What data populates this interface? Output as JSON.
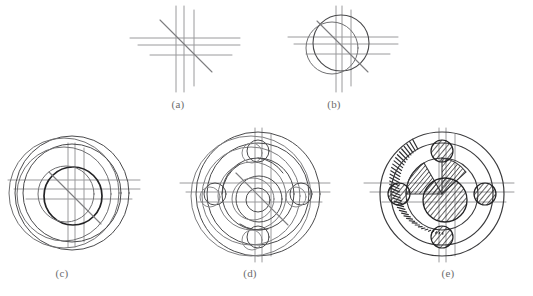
{
  "figure": {
    "background_color": "#ffffff",
    "line_color": "#4a4a4c",
    "construction_color": "#9a9a9c",
    "hatch_color": "#2e2e30",
    "width": 533,
    "height": 296
  },
  "panels": [
    {
      "id": "a",
      "caption": "(a)",
      "caption_x": 178,
      "caption_y": 103,
      "center_x": 185,
      "center_y": 45,
      "description": "Construction centrelines only: three vertical lines, three horizontal lines and one inclined 45-degree line crossing at the layout origin.",
      "vertical_lines": [
        176,
        184,
        194
      ],
      "horizontal_lines": [
        38,
        45,
        55
      ],
      "diagonal": {
        "x1": 160,
        "y1": 20,
        "x2": 212,
        "y2": 72
      },
      "vertical_extent": {
        "top": 6,
        "bottom": 92
      },
      "horizontal_extent": {
        "left": 130,
        "right": 240
      }
    },
    {
      "id": "b",
      "caption": "(b)",
      "caption_x": 334,
      "caption_y": 103,
      "center_x": 341,
      "center_y": 45,
      "description": "Two overlapping construction circles added on the same centreline grid, establishing the offset of the disc outline.",
      "circles": [
        {
          "cx": 341,
          "cy": 43,
          "r": 28
        },
        {
          "cx": 332,
          "cy": 48,
          "r": 26
        }
      ],
      "vertical_lines": [
        336,
        342,
        351
      ],
      "horizontal_lines": [
        37,
        44,
        54
      ],
      "diagonal": {
        "x1": 317,
        "y1": 21,
        "x2": 368,
        "y2": 72
      },
      "vertical_extent": {
        "top": 6,
        "bottom": 92
      },
      "horizontal_extent": {
        "left": 288,
        "right": 398
      }
    },
    {
      "id": "c",
      "caption": "(c)",
      "caption_x": 62,
      "caption_y": 272,
      "center_x": 70,
      "center_y": 193,
      "description": "Outer rim circles and the central bore outline are drawn, doubled to show the offset construction overlay.",
      "circles": [
        {
          "cx": 72,
          "cy": 193,
          "r": 57,
          "weight": "thin"
        },
        {
          "cx": 64,
          "cy": 193,
          "r": 55,
          "weight": "thin"
        },
        {
          "cx": 72,
          "cy": 193,
          "r": 49,
          "weight": "thin"
        },
        {
          "cx": 64,
          "cy": 194,
          "r": 47,
          "weight": "thin"
        },
        {
          "cx": 73,
          "cy": 196,
          "r": 29,
          "weight": "thick"
        },
        {
          "cx": 66,
          "cy": 194,
          "r": 28,
          "weight": "thin"
        }
      ],
      "vertical_lines": [
        68,
        75,
        84
      ],
      "horizontal_lines": [
        180,
        189,
        199
      ],
      "diagonal": {
        "x1": 49,
        "y1": 172,
        "x2": 101,
        "y2": 224
      },
      "vertical_extent": {
        "top": 143,
        "bottom": 247
      },
      "horizontal_extent": {
        "left": 8,
        "right": 140
      }
    },
    {
      "id": "d",
      "caption": "(d)",
      "caption_x": 250,
      "caption_y": 272,
      "center_x": 258,
      "center_y": 193,
      "description": "Bolt circle laid out with four equally spaced holes at the cardinal positions, plus inner boss circles.",
      "circles": [
        {
          "cx": 258,
          "cy": 194,
          "r": 62,
          "weight": "thin"
        },
        {
          "cx": 251,
          "cy": 196,
          "r": 60,
          "weight": "thin"
        },
        {
          "cx": 258,
          "cy": 194,
          "r": 51,
          "weight": "thin"
        },
        {
          "cx": 251,
          "cy": 196,
          "r": 49,
          "weight": "thin"
        },
        {
          "cx": 258,
          "cy": 194,
          "r": 36,
          "weight": "thin"
        },
        {
          "cx": 252,
          "cy": 196,
          "r": 34,
          "weight": "thin"
        },
        {
          "cx": 259,
          "cy": 199,
          "r": 23,
          "weight": "thin"
        },
        {
          "cx": 253,
          "cy": 199,
          "r": 21,
          "weight": "thin"
        },
        {
          "cx": 258,
          "cy": 200,
          "r": 12,
          "weight": "thin"
        }
      ],
      "bolt_circle_radius": 43,
      "bolt_holes": [
        {
          "cx": 258,
          "cy": 151,
          "r": 11
        },
        {
          "cx": 301,
          "cy": 194,
          "r": 11
        },
        {
          "cx": 258,
          "cy": 237,
          "r": 11
        },
        {
          "cx": 215,
          "cy": 194,
          "r": 11
        }
      ],
      "bolt_holes_offset": [
        {
          "cx": 252,
          "cy": 153,
          "r": 10
        },
        {
          "cx": 296,
          "cy": 197,
          "r": 10
        },
        {
          "cx": 252,
          "cy": 240,
          "r": 10
        },
        {
          "cx": 210,
          "cy": 197,
          "r": 10
        }
      ],
      "vertical_lines": [
        255,
        262,
        271
      ],
      "horizontal_lines": [
        183,
        192,
        202
      ],
      "diagonal": {
        "x1": 236,
        "y1": 173,
        "x2": 288,
        "y2": 225
      },
      "vertical_extent": {
        "top": 128,
        "bottom": 262
      },
      "horizontal_extent": {
        "left": 180,
        "right": 330
      }
    },
    {
      "id": "e",
      "caption": "(e)",
      "caption_x": 448,
      "caption_y": 272,
      "center_x": 442,
      "center_y": 193,
      "description": "Finished sectional view: rim band filled with radial hatching, and the four bolt holes plus the central boss rendered with section hatching at alternating angles.",
      "circles": [
        {
          "cx": 442,
          "cy": 194,
          "r": 62,
          "weight": "thin"
        },
        {
          "cx": 442,
          "cy": 194,
          "r": 51,
          "weight": "thin"
        },
        {
          "cx": 442,
          "cy": 194,
          "r": 36,
          "weight": "thin"
        },
        {
          "cx": 442,
          "cy": 199,
          "r": 23,
          "weight": "thin"
        }
      ],
      "rim_hatch": {
        "inner_r": 51,
        "outer_r": 62,
        "start_deg": 118,
        "end_deg": 262,
        "step_deg": 3.6
      },
      "bolt_holes": [
        {
          "cx": 442,
          "cy": 151,
          "r": 11,
          "hatch_angle": 40
        },
        {
          "cx": 485,
          "cy": 194,
          "r": 11,
          "hatch_angle": 40
        },
        {
          "cx": 442,
          "cy": 237,
          "r": 11,
          "hatch_angle": 40
        },
        {
          "cx": 399,
          "cy": 194,
          "r": 11,
          "hatch_angle": 40
        }
      ],
      "boss_hatch": {
        "cx": 445,
        "cy": 200,
        "r": 22,
        "angle": 40
      },
      "vertical_lines": [
        439,
        446,
        455
      ],
      "horizontal_lines": [
        183,
        192,
        202
      ],
      "vertical_extent": {
        "top": 128,
        "bottom": 262
      },
      "horizontal_extent": {
        "left": 364,
        "right": 514
      }
    }
  ]
}
